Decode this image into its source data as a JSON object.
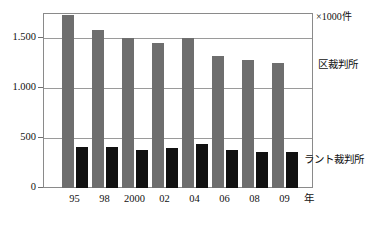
{
  "chart_data": {
    "type": "bar",
    "title": "",
    "subtitle": "",
    "unit_caption": "×1000件",
    "xlabel": "年",
    "ylabel": "",
    "categories": [
      "95",
      "98",
      "2000",
      "02",
      "04",
      "06",
      "08",
      "09"
    ],
    "ylim": [
      0,
      1750
    ],
    "yticks": [
      0,
      500,
      1000,
      1500
    ],
    "ytick_labels": [
      "0",
      "500",
      "1.000",
      "1.500"
    ],
    "grid": true,
    "legend_position": "inside-right",
    "series": [
      {
        "name": "区裁判所",
        "color": "#6e6e6e",
        "values": [
          1730,
          1580,
          1500,
          1450,
          1500,
          1320,
          1280,
          1250
        ]
      },
      {
        "name": "ラント裁判所",
        "color": "#111111",
        "values": [
          415,
          415,
          380,
          405,
          440,
          380,
          365,
          365
        ]
      }
    ],
    "annotations": [
      {
        "text": "区裁判所",
        "x_px": 318,
        "y_px": 59
      },
      {
        "text": "ラント裁判所",
        "x_px": 304,
        "y_px": 154
      }
    ]
  }
}
